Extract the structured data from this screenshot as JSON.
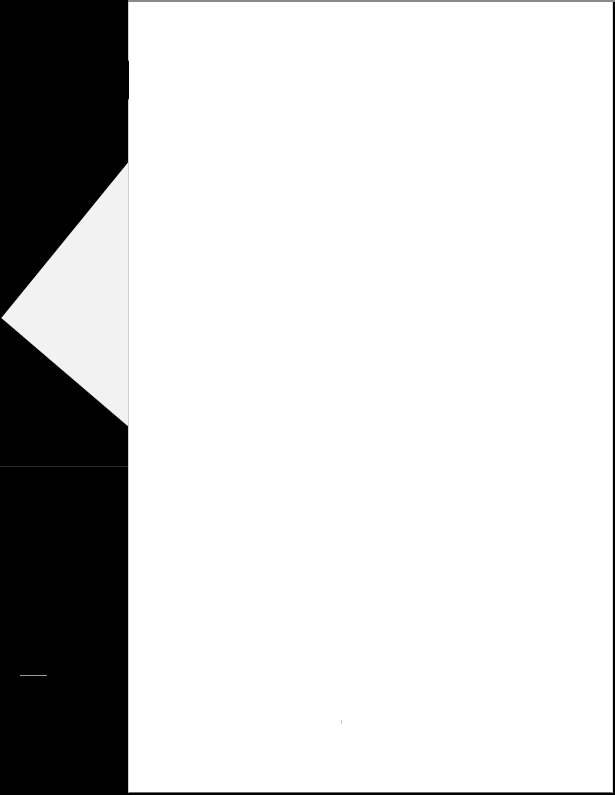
{
  "document": {
    "type": "scanned page",
    "page_content": "",
    "background_color": "#000000",
    "page_color": "#ffffff",
    "folded_corner_color": "#f2f2f2"
  }
}
